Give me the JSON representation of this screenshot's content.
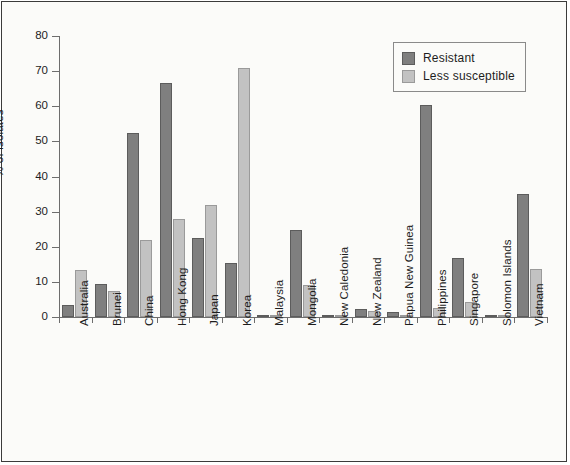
{
  "chart_data": {
    "type": "bar",
    "title": "",
    "xlabel": "",
    "ylabel": "% of isolates",
    "ylim": [
      0,
      80
    ],
    "yticks": [
      0,
      10,
      20,
      30,
      40,
      50,
      60,
      70,
      80
    ],
    "grid": false,
    "legend_position": "top-right",
    "categories": [
      "Australia",
      "Brunei",
      "China",
      "Hong Kong",
      "Japan",
      "Korea",
      "Malaysia",
      "Mongolia",
      "New Caledonia",
      "New Zealand",
      "Papua New Guinea",
      "Philippines",
      "Singapore",
      "Solomon Islands",
      "Vietnam"
    ],
    "series": [
      {
        "name": "Resistant",
        "color": "#7f7f7f",
        "values": [
          3.5,
          9.5,
          52.5,
          66.5,
          22.5,
          15.5,
          0.4,
          24.8,
          0.4,
          2.2,
          1.3,
          60.5,
          16.7,
          0.4,
          35.0
        ]
      },
      {
        "name": "Less susceptible",
        "color": "#c2c2c2",
        "values": [
          13.5,
          7.3,
          22.0,
          27.8,
          32.0,
          71.0,
          0.3,
          9.0,
          0.3,
          1.8,
          0.5,
          2.5,
          4.3,
          0.3,
          13.7
        ]
      }
    ]
  },
  "legend": {
    "items": [
      {
        "label": "Resistant"
      },
      {
        "label": "Less susceptible"
      }
    ]
  }
}
